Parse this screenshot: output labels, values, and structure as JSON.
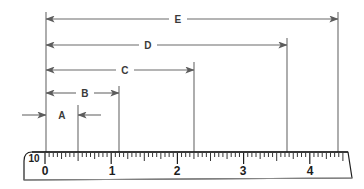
{
  "figure": {
    "background_color": "#ffffff",
    "line_color": "#6b6b6b",
    "ruler_color": "#1d1d1d"
  },
  "dimensions": [
    {
      "key": "A",
      "label": "A",
      "label_x": 62,
      "row_y": 115,
      "start_x": 46,
      "end_x": 78,
      "style": "outside",
      "left_tail_x": 22,
      "right_tail_x": 101,
      "value_start": 0.0,
      "value_end": 0.5,
      "length_inches": 0.5
    },
    {
      "key": "B",
      "label": "B",
      "label_x": 85,
      "row_y": 93,
      "start_x": 46,
      "end_x": 119,
      "style": "inside-split",
      "value_start": 0.0,
      "value_end": 1.1,
      "length_inches": 1.1
    },
    {
      "key": "C",
      "label": "C",
      "label_x": 125,
      "row_y": 70,
      "start_x": 46,
      "end_x": 194,
      "style": "inside-split",
      "value_start": 0.0,
      "value_end": 2.25,
      "length_inches": 2.25
    },
    {
      "key": "D",
      "label": "D",
      "label_x": 148,
      "row_y": 45,
      "start_x": 46,
      "end_x": 287,
      "style": "inside-split",
      "value_start": 0.0,
      "value_end": 3.6,
      "length_inches": 3.6
    },
    {
      "key": "E",
      "label": "E",
      "label_x": 178,
      "row_y": 19,
      "start_x": 46,
      "end_x": 338,
      "style": "inside-split",
      "value_start": 0.0,
      "value_end": 4.4,
      "length_inches": 4.4
    }
  ],
  "extension_lines": [
    {
      "x": 46,
      "top_y": 12,
      "bottom_y": 152
    },
    {
      "x": 78,
      "top_y": 105,
      "bottom_y": 152
    },
    {
      "x": 119,
      "top_y": 86,
      "bottom_y": 152
    },
    {
      "x": 194,
      "top_y": 62,
      "bottom_y": 152
    },
    {
      "x": 287,
      "top_y": 38,
      "bottom_y": 152
    },
    {
      "x": 338,
      "top_y": 12,
      "bottom_y": 152
    }
  ],
  "ruler": {
    "scale_label": "10",
    "scale_label_x": 34,
    "scale_label_y": 152,
    "zero_x": 45,
    "unit_px": 66.2,
    "top_y": 152,
    "body_bottom_y": 181,
    "tick_minor_count_per_unit": 16,
    "numbers": [
      {
        "text": "0",
        "x": 45,
        "value": 0
      },
      {
        "text": "1",
        "x": 112,
        "value": 1
      },
      {
        "text": "2",
        "x": 177,
        "value": 2
      },
      {
        "text": "3",
        "x": 243,
        "value": 3
      },
      {
        "text": "4",
        "x": 310,
        "value": 4
      }
    ],
    "number_y": 164,
    "left_end_x": 22,
    "right_end_x": 348,
    "units": "inches"
  },
  "chart_data": {
    "type": "bar",
    "xlabel": "inches",
    "ylabel": "",
    "categories": [
      "A",
      "B",
      "C",
      "D",
      "E"
    ],
    "values": [
      0.5,
      1.1,
      2.25,
      3.6,
      4.4
    ],
    "starts": [
      0.0,
      0.0,
      0.0,
      0.0,
      0.0
    ],
    "xlim": [
      0,
      4.6
    ],
    "grid": false,
    "legend": "none",
    "annotations": [
      "A spans 0 to 0.5 in (arrows point inward from outside)",
      "B spans 0 to 1.1 in",
      "C spans 0 to 2.25 in",
      "D spans 0 to 3.6 in",
      "E spans 0 to 4.4 in"
    ]
  }
}
